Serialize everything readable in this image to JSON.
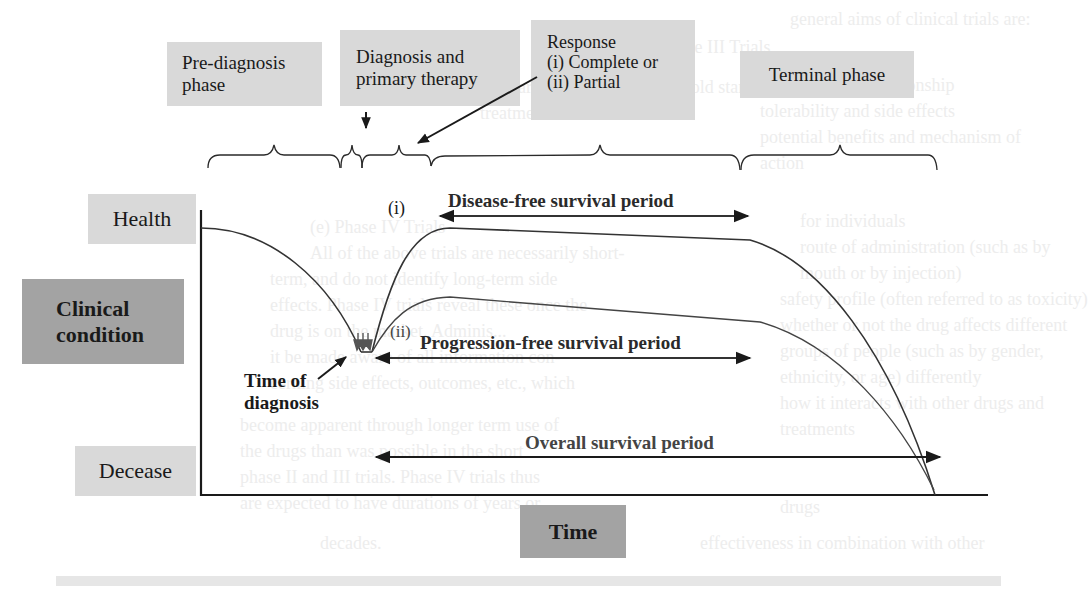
{
  "diagram": {
    "type": "clinical course timeline",
    "axes": {
      "y_label": "Clinical condition",
      "y_top": "Health",
      "y_bottom": "Decease",
      "x_label": "Time"
    },
    "phases": [
      {
        "label_lines": [
          "Pre-diagnosis",
          "phase"
        ]
      },
      {
        "label_lines": [
          "Diagnosis and",
          "primary therapy"
        ]
      },
      {
        "label_lines": [
          "Response",
          "(i) Complete or",
          "(ii) Partial"
        ]
      },
      {
        "label_lines": [
          "Terminal phase"
        ]
      }
    ],
    "annotations": {
      "time_of_diagnosis_lines": [
        "Time of",
        "diagnosis"
      ],
      "curve_i": "(i)",
      "curve_ii": "(ii)"
    },
    "periods": [
      {
        "label": "Disease-free survival period"
      },
      {
        "label": "Progression-free survival period"
      },
      {
        "label": "Overall survival period"
      }
    ]
  },
  "background_text": {
    "right_column_lines": [
      "general aims of clinical trials are:",
      "dose–response relationship",
      "tolerability and side effects",
      "potential benefits and mechanism of",
      "action",
      "for individuals",
      "route of administration (such as by",
      "mouth or by injection)",
      "safety profile (often referred to as toxicity)",
      "whether or not the drug affects different",
      "groups of people (such as by gender,",
      "ethnicity, or age) differently",
      "how it interacts with other drugs and",
      "treatments",
      "its effectiveness as compared with other",
      "drugs",
      "effectiveness in combination with other"
    ],
    "middle_column_heading_1": "(d) Phase III Trials",
    "middle_column_heading_2": "(e) Phase IV Trials",
    "middle_column_lines": [
      "large number of patients to assess the",
      "standard of care or current \"gold standard\"",
      "treatment",
      "All of the above trials are necessarily short-",
      "term, and do not identify long-term side",
      "effects. Phase IV trials reveal these once the",
      "drug is on the market. Adminis...",
      "it be made aware of all information con-",
      "cerning side effects, outcomes, etc., which",
      "become apparent through longer term use of",
      "the drugs than was possible in the short",
      "phase II and III trials. Phase IV trials thus",
      "are expected to have durations of years or",
      "decades."
    ]
  }
}
